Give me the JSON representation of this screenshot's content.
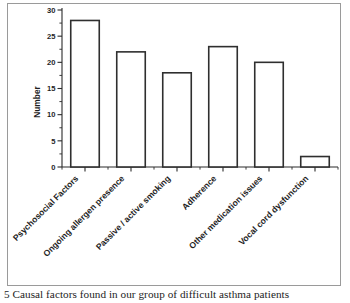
{
  "figure": {
    "caption": "5 Causal factors found in our group of difficult asthma patients",
    "frame_color": "#9a9a9a",
    "background": "#ffffff"
  },
  "chart_data": {
    "type": "bar",
    "title": "",
    "xlabel": "",
    "ylabel": "Number",
    "ylim": [
      0,
      30
    ],
    "ytick_labels": [
      "0",
      "5",
      "10",
      "15",
      "20",
      "25",
      "30"
    ],
    "ytick_values": [
      0,
      5,
      10,
      15,
      20,
      25,
      30
    ],
    "minor_ticks": true,
    "grid": false,
    "legend": false,
    "bar_fill": "#ffffff",
    "bar_edge": "#2f2f2f",
    "categories": [
      "Psychosocial Factors",
      "Ongoing allergen presence",
      "Passive / active smoking",
      "Adherence",
      "Other medication issues",
      "Vocal cord dysfunction"
    ],
    "values": [
      28,
      22,
      18,
      23,
      20,
      2
    ],
    "xtick_label_rotation": 45
  }
}
